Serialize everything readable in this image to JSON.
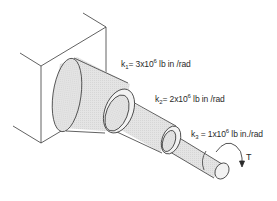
{
  "diagram": {
    "type": "stepped-shaft-torsion",
    "stiffness_labels": [
      {
        "symbol": "k",
        "subscript": "1",
        "eq": "= 3x10",
        "exp": "6",
        "unit": " lb in /rad"
      },
      {
        "symbol": "k",
        "subscript": "2",
        "eq": "= 2x10",
        "exp": "6",
        "unit": " lb in /rad"
      },
      {
        "symbol": "k",
        "subscript": "3",
        "eq": " = 1x10",
        "exp": "6",
        "unit": " lb in./rad"
      }
    ],
    "torque_label": "T",
    "colors": {
      "line": "#3a3a3a",
      "shaft_fill": "#e6e6e6",
      "end_face_fill": "#f2f2f2",
      "background": "#ffffff"
    }
  }
}
